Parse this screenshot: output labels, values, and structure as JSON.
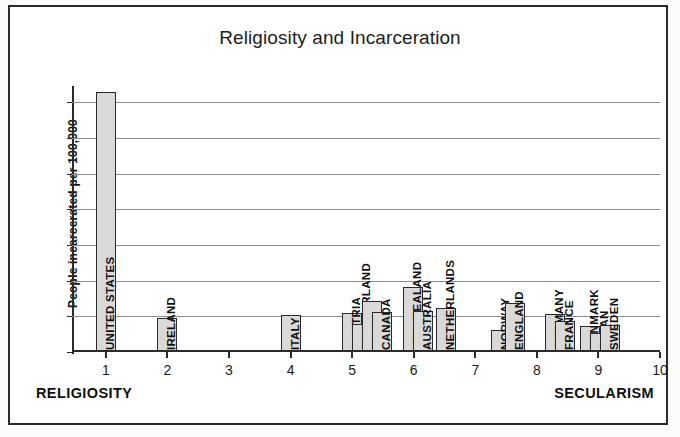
{
  "chart_data": {
    "type": "bar",
    "title": "Religiosity and Incarceration",
    "xlabel": "",
    "ylabel": "People incarcerated per 100,000",
    "xlim": [
      0.45,
      10.0
    ],
    "ylim": [
      0,
      740
    ],
    "grid": true,
    "legend": null,
    "y_ticks": [
      700,
      600,
      500,
      400,
      300,
      200,
      100,
      0
    ],
    "x_ticks": [
      1,
      2,
      3,
      4,
      5,
      6,
      7,
      8,
      9,
      10
    ],
    "annotations": {
      "axis_left": "RELIGIOSITY",
      "axis_right": "SECULARISM"
    },
    "categories": [
      "UNITED STATES",
      "IRELAND",
      "ITALY",
      "AUSTRIA",
      "SWITZERLAND",
      "SPAIN",
      "CANADA",
      "NEW ZEALAND",
      "AUSTRALIA",
      "NETHERLANDS",
      "NORWAY",
      "ENGLAND",
      "GERMANY",
      "FRANCE",
      "DENMARK",
      "JAPAN",
      "SWEDEN"
    ],
    "values": [
      725,
      93,
      100,
      107,
      77,
      140,
      108,
      180,
      113,
      120,
      60,
      135,
      105,
      85,
      70,
      50,
      73
    ],
    "points": [
      {
        "label": "UNITED STATES",
        "x": 1.0,
        "value": 725
      },
      {
        "label": "IRELAND",
        "x": 2.0,
        "value": 93
      },
      {
        "label": "ITALY",
        "x": 4.0,
        "value": 100
      },
      {
        "label": "AUSTRIA",
        "x": 5.0,
        "value": 107
      },
      {
        "label": "SWITZERLAND",
        "x": 5.16,
        "value": 77
      },
      {
        "label": "SPAIN",
        "x": 5.32,
        "value": 140
      },
      {
        "label": "CANADA",
        "x": 5.48,
        "value": 108
      },
      {
        "label": "NEW ZEALAND",
        "x": 5.99,
        "value": 180
      },
      {
        "label": "AUSTRALIA",
        "x": 6.15,
        "value": 113
      },
      {
        "label": "NETHERLANDS",
        "x": 6.52,
        "value": 120
      },
      {
        "label": "NORWAY",
        "x": 7.41,
        "value": 60
      },
      {
        "label": "ENGLAND",
        "x": 7.64,
        "value": 135
      },
      {
        "label": "GERMANY",
        "x": 8.29,
        "value": 105
      },
      {
        "label": "FRANCE",
        "x": 8.45,
        "value": 85
      },
      {
        "label": "DENMARK",
        "x": 8.86,
        "value": 70
      },
      {
        "label": "JAPAN",
        "x": 9.02,
        "value": 50
      },
      {
        "label": "SWEDEN",
        "x": 9.19,
        "value": 73
      }
    ],
    "colors": {
      "bar_fill": "#d9d9d9",
      "bar_edge": "#2a2a2a",
      "grid": "#8c8c8c",
      "axis": "#2b2b2b",
      "text": "#1b1b1b",
      "background": "#ffffff"
    }
  }
}
